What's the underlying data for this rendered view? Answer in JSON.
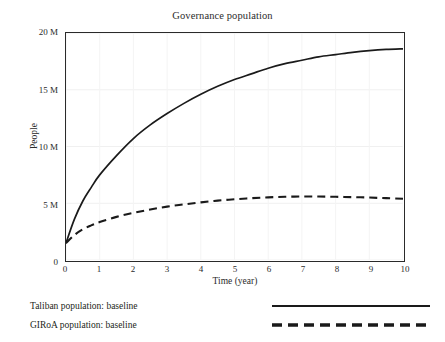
{
  "chart_data": {
    "type": "line",
    "title": "Governance population",
    "xlabel": "Time (year)",
    "ylabel": "People",
    "xlim": [
      0,
      10
    ],
    "ylim": [
      0,
      20000000
    ],
    "xticks": [
      "0",
      "1",
      "2",
      "3",
      "4",
      "5",
      "6",
      "7",
      "8",
      "9",
      "10"
    ],
    "xtick_values": [
      0,
      1,
      2,
      3,
      4,
      5,
      6,
      7,
      8,
      9,
      10
    ],
    "yticks": [
      "0",
      "5 M",
      "10 M",
      "15 M",
      "20 M"
    ],
    "ytick_values": [
      0,
      5000000,
      10000000,
      15000000,
      20000000
    ],
    "grid": true,
    "legend_position": "below-axis",
    "x": [
      0,
      0.25,
      0.5,
      0.75,
      1,
      1.5,
      2,
      2.5,
      3,
      3.5,
      4,
      4.5,
      5,
      5.5,
      6,
      6.5,
      7,
      7.5,
      8,
      8.5,
      9,
      9.5,
      10
    ],
    "series": [
      {
        "name": "Taliban population: baseline",
        "style": "solid",
        "color": "#1a1a1a",
        "values": [
          1500000,
          3600000,
          5200000,
          6400000,
          7500000,
          9200000,
          10700000,
          11900000,
          12900000,
          13800000,
          14600000,
          15300000,
          15900000,
          16400000,
          16900000,
          17300000,
          17600000,
          17900000,
          18100000,
          18300000,
          18450000,
          18550000,
          18600000
        ]
      },
      {
        "name": "GIRoA population: baseline",
        "style": "dashed",
        "color": "#1a1a1a",
        "values": [
          1500000,
          2200000,
          2700000,
          3050000,
          3350000,
          3800000,
          4150000,
          4450000,
          4700000,
          4900000,
          5080000,
          5230000,
          5350000,
          5450000,
          5520000,
          5570000,
          5590000,
          5590000,
          5570000,
          5540000,
          5500000,
          5450000,
          5400000
        ]
      }
    ]
  },
  "legend": {
    "items": [
      {
        "label": "Taliban population: baseline",
        "style": "solid"
      },
      {
        "label": "GIRoA population: baseline",
        "style": "dashed"
      }
    ]
  }
}
